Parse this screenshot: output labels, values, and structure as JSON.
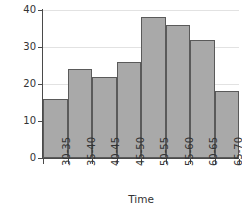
{
  "figure": {
    "partial_label": ")",
    "background_color": "#ffffff",
    "bar_fill_color": "#a9a9a9",
    "bar_border_color": "#5a5a5a",
    "axis_color": "#4a4a4a",
    "gridline_color": "#e2e2e2"
  },
  "chart_data": {
    "type": "bar",
    "title": "",
    "xlabel": "Time",
    "ylabel": "Frequency",
    "categories": [
      "30-35",
      "35-40",
      "40-45",
      "45-50",
      "50-55",
      "55-60",
      "60-65",
      "65-70"
    ],
    "values": [
      16,
      24,
      22,
      26,
      38,
      36,
      32,
      18
    ],
    "ylim": [
      0,
      40
    ],
    "yticks": [
      0,
      10,
      20,
      30,
      40
    ],
    "ytick_labels": [
      "0",
      "10",
      "20",
      "30",
      "40"
    ],
    "grid": true,
    "grid_axis": "y",
    "legend": null,
    "legend_position": "none",
    "xtick_rotation": 90
  }
}
